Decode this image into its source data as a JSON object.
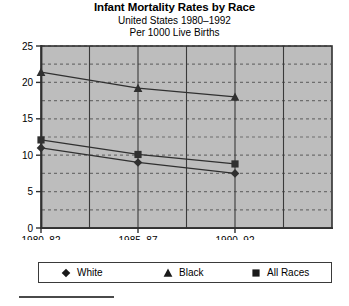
{
  "chart_data": {
    "type": "line",
    "title": "Infant Mortality Rates by Race",
    "subtitle1": "United States 1980–1992",
    "subtitle2": "Per 1000 Live Births",
    "xlabel": "",
    "ylabel": "",
    "categories": [
      "1980–82",
      "1985–87",
      "1990–92"
    ],
    "series": [
      {
        "name": "White",
        "marker": "diamond",
        "values": [
          11.0,
          9.0,
          7.5
        ]
      },
      {
        "name": "Black",
        "marker": "triangle",
        "values": [
          21.4,
          19.2,
          18.0
        ]
      },
      {
        "name": "All Races",
        "marker": "square",
        "values": [
          12.1,
          10.1,
          8.8
        ]
      }
    ],
    "ylim": [
      0,
      25
    ],
    "yticks": [
      0,
      5,
      10,
      15,
      20,
      25
    ],
    "ytick_labels": [
      "0",
      "5",
      "10",
      "15",
      "20",
      "25"
    ],
    "minor_gridlines": [
      2.5,
      7.5,
      12.5,
      17.5,
      22.5
    ],
    "vertical_gridline_count": 6,
    "grid": true,
    "legend_position": "bottom",
    "plot_background": "#bdbdbd",
    "line_color": "#303030",
    "axis_color": "#303030",
    "grid_color": "#6e6e6e"
  },
  "legend": {
    "items": [
      {
        "label": "White",
        "marker": "diamond"
      },
      {
        "label": "Black",
        "marker": "triangle"
      },
      {
        "label": "All Races",
        "marker": "square"
      }
    ]
  }
}
